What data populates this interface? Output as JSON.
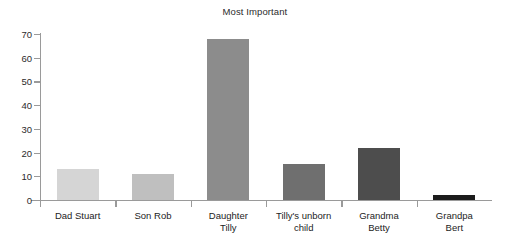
{
  "chart_data": {
    "type": "bar",
    "title": "Most Important",
    "xlabel": "",
    "ylabel": "",
    "ylim": [
      0,
      70
    ],
    "ytick_step": 10,
    "yticks": [
      0,
      10,
      20,
      30,
      40,
      50,
      60,
      70
    ],
    "grid": false,
    "legend": false,
    "categories": [
      "Dad Stuart",
      "Son Rob",
      "Daughter Tilly",
      "Tilly's unborn child",
      "Grandma Betty",
      "Grandpa Bert"
    ],
    "values": [
      13,
      11,
      68,
      15,
      22,
      2
    ],
    "bar_colors": [
      "#d5d5d5",
      "#bfbfbf",
      "#8c8c8c",
      "#6f6f6f",
      "#4d4d4d",
      "#1c1c1c"
    ]
  },
  "axis": {
    "y_tick_labels": [
      "70",
      "60",
      "50",
      "40",
      "30",
      "20",
      "10",
      "0"
    ],
    "category_label_lines": [
      [
        "Dad Stuart"
      ],
      [
        "Son Rob"
      ],
      [
        "Daughter",
        "Tilly"
      ],
      [
        "Tilly's unborn",
        "child"
      ],
      [
        "Grandma",
        "Betty"
      ],
      [
        "Grandpa",
        "Bert"
      ]
    ]
  }
}
